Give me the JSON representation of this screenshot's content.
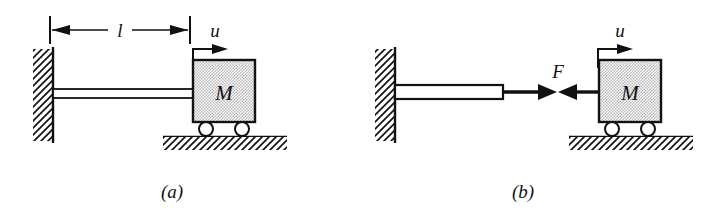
{
  "figure": {
    "background_color": "#ffffff",
    "ink_color": "#111111",
    "panels": [
      {
        "id": "a",
        "caption": "(a)",
        "description": "Mass M on rollers connected by a rod to a fixed wall",
        "labels": {
          "length": "l",
          "displacement": "u",
          "mass": "M"
        },
        "elements": [
          "fixed-wall-hatched",
          "dimension-line-l",
          "displacement-arrow-u",
          "connecting-rod",
          "mass-block",
          "wheel-left",
          "wheel-right",
          "ground-hatched"
        ]
      },
      {
        "id": "b",
        "caption": "(b)",
        "description": "Free body diagram with internal force F separating rod and mass",
        "labels": {
          "force": "F",
          "displacement": "u",
          "mass": "M"
        },
        "elements": [
          "fixed-wall-hatched",
          "displacement-arrow-u",
          "detached-rod",
          "force-arrow-right",
          "force-arrow-left",
          "mass-block",
          "wheel-left",
          "wheel-right",
          "ground-hatched"
        ]
      }
    ]
  }
}
